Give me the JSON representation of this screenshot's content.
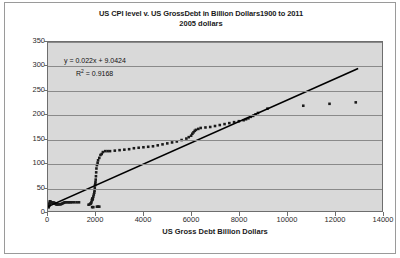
{
  "chart_data": {
    "type": "scatter",
    "title": "US CPI level v. US GrossDebt in Billion Dollars1900 to 2011",
    "subtitle": "2005 dollars",
    "xlabel": "US Gross Debt Billion Dollars",
    "ylabel": "US CPI",
    "xlim": [
      0,
      14000
    ],
    "ylim": [
      0,
      350
    ],
    "xticks": [
      0,
      2000,
      4000,
      6000,
      8000,
      10000,
      12000,
      14000
    ],
    "yticks": [
      0,
      50,
      100,
      150,
      200,
      250,
      300,
      350
    ],
    "grid": "horizontal",
    "legend": "none",
    "plot_background": "#d9d9d9",
    "marker_color": "#1a1a1a",
    "trendline_color": "#000000",
    "annotations": [
      "y = 0.022x + 9.0424",
      "R² = 0.9168"
    ],
    "trendline": {
      "slope": 0.022,
      "intercept": 9.0424,
      "r_squared": 0.9168,
      "x_start": 0,
      "x_end": 13000
    },
    "series": [
      {
        "name": "US CPI vs US Gross Debt",
        "points": [
          [
            20,
            8
          ],
          [
            22,
            8
          ],
          [
            24,
            9
          ],
          [
            25,
            9
          ],
          [
            27,
            10
          ],
          [
            30,
            10
          ],
          [
            32,
            10
          ],
          [
            35,
            11
          ],
          [
            38,
            11
          ],
          [
            40,
            12
          ],
          [
            45,
            12
          ],
          [
            50,
            13
          ],
          [
            55,
            14
          ],
          [
            60,
            15
          ],
          [
            70,
            17
          ],
          [
            80,
            20
          ],
          [
            90,
            20
          ],
          [
            100,
            19
          ],
          [
            120,
            18
          ],
          [
            140,
            17
          ],
          [
            160,
            17
          ],
          [
            180,
            17
          ],
          [
            200,
            17
          ],
          [
            220,
            17
          ],
          [
            240,
            17
          ],
          [
            260,
            17
          ],
          [
            280,
            16
          ],
          [
            300,
            16
          ],
          [
            320,
            15
          ],
          [
            340,
            14
          ],
          [
            360,
            14
          ],
          [
            380,
            14
          ],
          [
            400,
            14
          ],
          [
            430,
            14
          ],
          [
            460,
            14
          ],
          [
            500,
            14
          ],
          [
            540,
            14
          ],
          [
            580,
            15
          ],
          [
            620,
            16
          ],
          [
            660,
            17
          ],
          [
            700,
            18
          ],
          [
            760,
            18
          ],
          [
            820,
            18
          ],
          [
            880,
            18
          ],
          [
            940,
            18
          ],
          [
            1000,
            18
          ],
          [
            1100,
            18
          ],
          [
            1200,
            18
          ],
          [
            1300,
            18
          ],
          [
            1700,
            13
          ],
          [
            1750,
            14
          ],
          [
            1780,
            15
          ],
          [
            1800,
            16
          ],
          [
            1820,
            18
          ],
          [
            1840,
            22
          ],
          [
            1850,
            24
          ],
          [
            1860,
            26
          ],
          [
            1870,
            24
          ],
          [
            1880,
            26
          ],
          [
            1900,
            30
          ],
          [
            1920,
            34
          ],
          [
            1940,
            38
          ],
          [
            1950,
            42
          ],
          [
            1960,
            47
          ],
          [
            1970,
            53
          ],
          [
            1980,
            56
          ],
          [
            1990,
            60
          ],
          [
            2000,
            65
          ],
          [
            2010,
            72
          ],
          [
            2020,
            80
          ],
          [
            2030,
            88
          ],
          [
            2050,
            95
          ],
          [
            2080,
            100
          ],
          [
            2100,
            105
          ],
          [
            2150,
            110
          ],
          [
            2200,
            116
          ],
          [
            2250,
            118
          ],
          [
            2300,
            122
          ],
          [
            2400,
            124
          ],
          [
            2500,
            124
          ],
          [
            2600,
            124
          ],
          [
            2800,
            125
          ],
          [
            3000,
            126
          ],
          [
            3200,
            127
          ],
          [
            3400,
            128
          ],
          [
            3600,
            130
          ],
          [
            3800,
            131
          ],
          [
            4000,
            132
          ],
          [
            4200,
            133
          ],
          [
            4400,
            134
          ],
          [
            4600,
            136
          ],
          [
            4800,
            138
          ],
          [
            5000,
            140
          ],
          [
            5200,
            142
          ],
          [
            5400,
            144
          ],
          [
            5600,
            147
          ],
          [
            5800,
            150
          ],
          [
            5900,
            153
          ],
          [
            6000,
            156
          ],
          [
            6050,
            160
          ],
          [
            6100,
            163
          ],
          [
            6150,
            166
          ],
          [
            6200,
            168
          ],
          [
            6300,
            170
          ],
          [
            6400,
            172
          ],
          [
            6600,
            173
          ],
          [
            6800,
            174
          ],
          [
            7000,
            176
          ],
          [
            7200,
            178
          ],
          [
            7400,
            180
          ],
          [
            7600,
            182
          ],
          [
            7800,
            184
          ],
          [
            8000,
            186
          ],
          [
            8200,
            188
          ],
          [
            8300,
            190
          ],
          [
            8400,
            192
          ],
          [
            8500,
            195
          ],
          [
            8600,
            197
          ],
          [
            8700,
            200
          ],
          [
            8800,
            203
          ],
          [
            9200,
            212
          ],
          [
            10700,
            218
          ],
          [
            11800,
            222
          ],
          [
            12900,
            225
          ],
          [
            1850,
            8
          ],
          [
            1900,
            8
          ],
          [
            2050,
            9
          ],
          [
            2100,
            9
          ],
          [
            2150,
            9
          ]
        ]
      }
    ]
  },
  "axis": {
    "ytick_labels": [
      "350",
      "300",
      "250",
      "200",
      "150",
      "100",
      "50",
      "0"
    ],
    "xtick_labels": [
      "0",
      "2000",
      "4000",
      "6000",
      "8000",
      "10000",
      "12000",
      "14000"
    ]
  },
  "equation": {
    "line1": "y = 0.022x + 9.0424",
    "r_prefix": "R",
    "r_sup": "2",
    "r_value": " = 0.9168"
  }
}
